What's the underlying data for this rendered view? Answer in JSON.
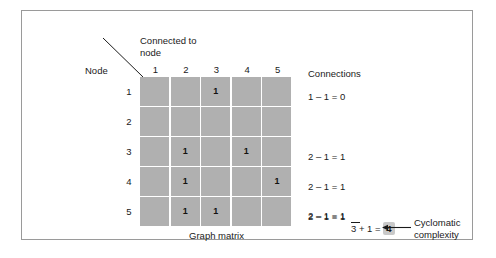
{
  "figure": {
    "caption": "Graph matrix",
    "header_connected": "Connected to\nnode",
    "header_node": "Node",
    "border_color": "#9a9a9a",
    "cell_color": "#b0b0b0",
    "highlight_color": "#c9c9c9"
  },
  "matrix": {
    "column_headers": [
      "1",
      "2",
      "3",
      "4",
      "5"
    ],
    "row_headers": [
      "1",
      "2",
      "3",
      "4",
      "5"
    ],
    "rows": [
      [
        "",
        "",
        "1",
        "",
        ""
      ],
      [
        "",
        "",
        "",
        "",
        ""
      ],
      [
        "",
        "1",
        "",
        "1",
        ""
      ],
      [
        "",
        "1",
        "",
        "",
        "1"
      ],
      [
        "",
        "1",
        "1",
        "",
        ""
      ]
    ]
  },
  "connections": {
    "title": "Connections",
    "rows": [
      "1 – 1 = 0",
      "",
      "2 – 1 = 1",
      "2 – 1 = 1",
      "2 – 1 = 1"
    ]
  },
  "summary": {
    "top_expression": "2 – 1 = 1",
    "sum_total": "3",
    "plus_expression": "+ 1 =",
    "result": "4",
    "annotation": "Cyclomatic\ncomplexity"
  },
  "chart_data": {
    "type": "table",
    "title": "Graph matrix",
    "xlabel": "Connected to node",
    "ylabel": "Node",
    "categories": [
      "1",
      "2",
      "3",
      "4",
      "5"
    ],
    "series": [
      {
        "name": "1",
        "values": [
          0,
          0,
          1,
          0,
          0
        ]
      },
      {
        "name": "2",
        "values": [
          0,
          0,
          0,
          0,
          0
        ]
      },
      {
        "name": "3",
        "values": [
          0,
          1,
          0,
          1,
          0
        ]
      },
      {
        "name": "4",
        "values": [
          0,
          1,
          0,
          0,
          1
        ]
      },
      {
        "name": "5",
        "values": [
          0,
          1,
          1,
          0,
          0
        ]
      }
    ],
    "annotations": [
      "1 – 1 = 0",
      "2 – 1 = 1",
      "2 – 1 = 1",
      "2 – 1 = 1",
      "3 + 1 = 4",
      "Cyclomatic complexity"
    ]
  }
}
